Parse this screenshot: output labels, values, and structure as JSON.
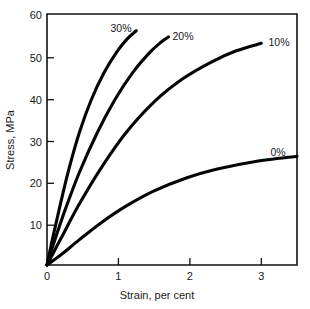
{
  "chart_data": {
    "type": "line",
    "title": "",
    "xlabel": "Strain, per cent",
    "ylabel": "Stress, MPa",
    "xlim": [
      0,
      3.5
    ],
    "ylim": [
      0,
      60
    ],
    "xticks": [
      "0",
      "1",
      "2",
      "3"
    ],
    "xtick_values": [
      0,
      1,
      2,
      3
    ],
    "yticks": [
      "10",
      "20",
      "30",
      "40",
      "50",
      "60"
    ],
    "ytick_values": [
      10,
      20,
      30,
      40,
      50,
      60
    ],
    "grid": false,
    "legend": "inline-end-labels",
    "series": [
      {
        "name": "30%",
        "label": "30%",
        "x": [
          0,
          0.08,
          0.18,
          0.3,
          0.45,
          0.62,
          0.8,
          0.98,
          1.12,
          1.25
        ],
        "y": [
          0,
          6.5,
          14.0,
          22.5,
          31.5,
          39.5,
          46.0,
          51.0,
          54.0,
          56.0
        ]
      },
      {
        "name": "20%",
        "label": "20%",
        "x": [
          0,
          0.1,
          0.25,
          0.45,
          0.7,
          0.95,
          1.2,
          1.45,
          1.6,
          1.7
        ],
        "y": [
          0,
          5.5,
          13.0,
          22.0,
          31.5,
          39.5,
          46.0,
          51.0,
          53.3,
          54.5
        ]
      },
      {
        "name": "10%",
        "label": "10%",
        "x": [
          0,
          0.2,
          0.45,
          0.75,
          1.1,
          1.5,
          1.9,
          2.3,
          2.65,
          3.0
        ],
        "y": [
          0,
          6.5,
          14.5,
          23.0,
          31.5,
          39.0,
          44.5,
          48.5,
          51.2,
          53.0
        ]
      },
      {
        "name": "0%",
        "label": "0%",
        "x": [
          0,
          0.2,
          0.45,
          0.75,
          1.1,
          1.5,
          1.95,
          2.4,
          2.9,
          3.5
        ],
        "y": [
          0,
          2.5,
          6.0,
          10.0,
          14.0,
          17.7,
          20.8,
          23.0,
          24.7,
          26.0
        ]
      }
    ],
    "series_label_positions": [
      {
        "name": "30%",
        "x": 1.0,
        "y": 57.5
      },
      {
        "name": "20%",
        "x": 1.85,
        "y": 55.0
      },
      {
        "name": "10%",
        "x": 3.1,
        "y": 52.5
      },
      {
        "name": "0%",
        "x": 3.15,
        "y": 29.0
      }
    ],
    "colors": {
      "curve": "#050505",
      "axis": "#111111",
      "text": "#1a1a1a",
      "background": "#ffffff"
    }
  }
}
